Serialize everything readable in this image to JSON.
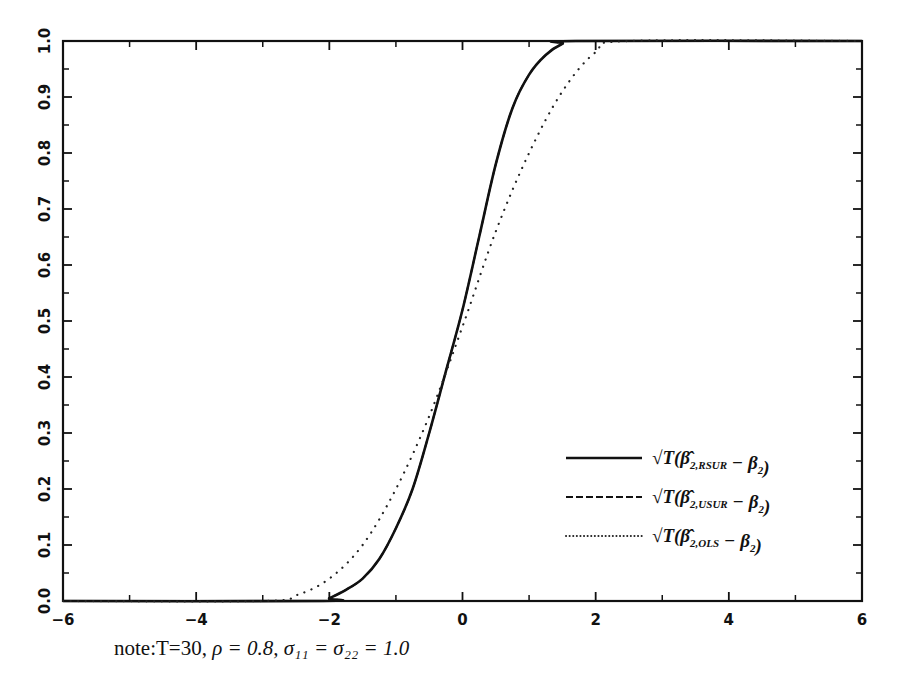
{
  "chart_data": {
    "type": "line",
    "title": "",
    "xlabel": "",
    "ylabel": "",
    "xlim": [
      -6,
      6
    ],
    "ylim": [
      0,
      1
    ],
    "grid": false,
    "legend_position": "lower right",
    "x_ticks": [
      -6,
      -4,
      -2,
      0,
      2,
      4,
      6
    ],
    "x_tick_labels": [
      "-6",
      "-4",
      "-2",
      "0",
      "2",
      "4",
      "6"
    ],
    "x_minor_ticks": [
      -5,
      -3,
      -1,
      1,
      3,
      5
    ],
    "y_ticks": [
      0.0,
      0.1,
      0.2,
      0.3,
      0.4,
      0.5,
      0.6,
      0.7,
      0.8,
      0.9,
      1.0
    ],
    "y_tick_labels": [
      "0.0",
      "0.1",
      "0.2",
      "0.3",
      "0.4",
      "0.5",
      "0.6",
      "0.7",
      "0.8",
      "0.9",
      "1.0"
    ],
    "series": [
      {
        "name": "√T(β̂2,RSUR − β2)",
        "style": "solid",
        "x": [
          -6,
          -2.1,
          -2.0,
          -1.75,
          -1.5,
          -1.25,
          -1.0,
          -0.75,
          -0.5,
          -0.25,
          0.0,
          0.25,
          0.5,
          0.75,
          1.0,
          1.25,
          1.5,
          1.7,
          6
        ],
        "values": [
          0,
          0,
          0.005,
          0.02,
          0.04,
          0.075,
          0.13,
          0.2,
          0.3,
          0.41,
          0.52,
          0.65,
          0.78,
          0.88,
          0.94,
          0.975,
          0.995,
          1.0,
          1.0
        ]
      },
      {
        "name": "√T(β̂2,USUR − β2)",
        "style": "dashed",
        "x": [
          -6,
          -2.1,
          -2.0,
          -1.75,
          -1.5,
          -1.25,
          -1.0,
          -0.75,
          -0.5,
          -0.25,
          0.0,
          0.25,
          0.5,
          0.75,
          1.0,
          1.25,
          1.5,
          1.7,
          6
        ],
        "values": [
          0,
          0,
          0.005,
          0.02,
          0.04,
          0.075,
          0.13,
          0.2,
          0.3,
          0.41,
          0.52,
          0.65,
          0.78,
          0.88,
          0.94,
          0.975,
          0.995,
          1.0,
          1.0
        ]
      },
      {
        "name": "√T(β̂2,OLS − β2)",
        "style": "dotted",
        "x": [
          -6,
          -3.0,
          -2.5,
          -2.0,
          -1.5,
          -1.0,
          -0.5,
          0.0,
          0.5,
          1.0,
          1.5,
          2.0,
          2.5,
          6
        ],
        "values": [
          0,
          0,
          0.01,
          0.04,
          0.1,
          0.2,
          0.33,
          0.49,
          0.66,
          0.8,
          0.91,
          0.98,
          1.0,
          1.0
        ]
      }
    ],
    "annotations": [
      "note:T=30, ρ = 0.8, σ11 = σ22 = 1.0"
    ]
  },
  "legend": {
    "items": [
      {
        "prefix": "√T(β̂",
        "sub": "2,RSUR",
        "suffix": " − β",
        "sub2": "2",
        "close": ")",
        "style": "solid"
      },
      {
        "prefix": "√T(β̂",
        "sub": "2,USUR",
        "suffix": " − β",
        "sub2": "2",
        "close": ")",
        "style": "dashed"
      },
      {
        "prefix": "√T(β̂",
        "sub": "2,OLS",
        "suffix": " − β",
        "sub2": "2",
        "close": ")",
        "style": "dotted"
      }
    ]
  },
  "note": {
    "label": "note:",
    "text": "T=30, ",
    "rho": "ρ = 0.8, ",
    "sigma": "σ₁₁ = σ₂₂ = 1.0"
  }
}
